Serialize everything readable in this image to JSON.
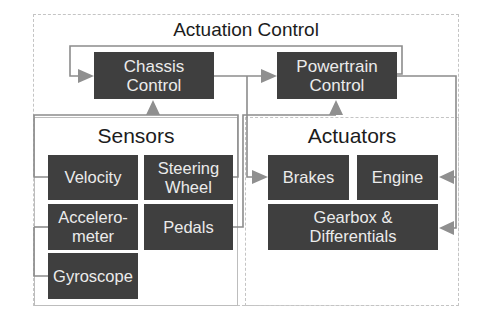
{
  "diagram": {
    "title": "Actuation Control",
    "colors": {
      "block_fill": "#3f3f3f",
      "block_text": "#ebebeb",
      "wire": "#8c8c8c",
      "arrow": "#8f8f8f",
      "frame": "#c4c4c4"
    },
    "controllers": [
      {
        "id": "chassis",
        "label": "Chassis\nControl"
      },
      {
        "id": "powertrain",
        "label": "Powertrain\nControl"
      }
    ],
    "sensors": {
      "title": "Sensors",
      "items": [
        {
          "id": "velocity",
          "label": "Velocity"
        },
        {
          "id": "steering-wheel",
          "label": "Steering\nWheel"
        },
        {
          "id": "accelerometer",
          "label": "Accelero-\nmeter"
        },
        {
          "id": "pedals",
          "label": "Pedals"
        },
        {
          "id": "gyroscope",
          "label": "Gyroscope"
        }
      ]
    },
    "actuators": {
      "title": "Actuators",
      "items": [
        {
          "id": "brakes",
          "label": "Brakes"
        },
        {
          "id": "engine",
          "label": "Engine"
        },
        {
          "id": "gearbox",
          "label": "Gearbox &\nDifferentials"
        }
      ]
    },
    "connections": [
      {
        "from": "velocity",
        "to": "chassis"
      },
      {
        "from": "accelerometer",
        "to": "chassis"
      },
      {
        "from": "gyroscope",
        "to": "chassis"
      },
      {
        "from": "steering-wheel",
        "to": "chassis"
      },
      {
        "from": "pedals",
        "to": "powertrain"
      },
      {
        "from": "chassis",
        "to": "powertrain"
      },
      {
        "from": "chassis",
        "to": "brakes"
      },
      {
        "from": "powertrain",
        "to": "chassis"
      },
      {
        "from": "powertrain",
        "to": "engine"
      },
      {
        "from": "powertrain",
        "to": "gearbox"
      }
    ]
  }
}
